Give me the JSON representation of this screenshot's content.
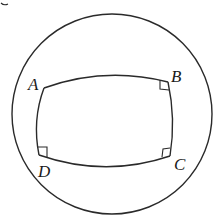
{
  "figure": {
    "circle": {
      "cx": 112,
      "cy": 114,
      "r": 100
    },
    "vertices": [
      {
        "name": "A",
        "x": 44,
        "y": 88,
        "label": "A",
        "label_x": 26,
        "label_y": 88,
        "right_angle": false
      },
      {
        "name": "B",
        "x": 168,
        "y": 82,
        "label": "B",
        "label_x": 172,
        "label_y": 82,
        "right_angle": true
      },
      {
        "name": "C",
        "x": 170,
        "y": 156,
        "label": "C",
        "label_x": 173,
        "label_y": 170,
        "right_angle": true
      },
      {
        "name": "D",
        "x": 39,
        "y": 155,
        "label": "D",
        "label_x": 38,
        "label_y": 178,
        "right_angle": true
      }
    ],
    "right_angle_markers": [
      "B",
      "C",
      "D"
    ],
    "stroke_color": "#2a2a2a"
  }
}
